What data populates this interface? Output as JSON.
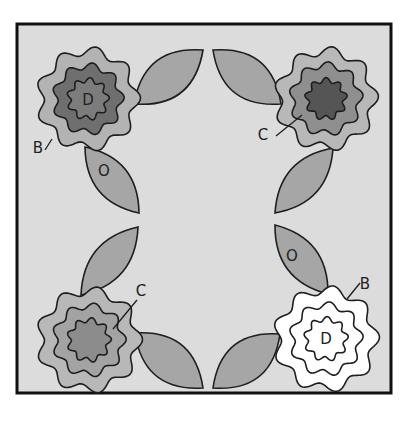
{
  "diagram": {
    "title": "",
    "frame": {
      "x": 17,
      "y": 24,
      "width": 374,
      "height": 369,
      "fill": "#dcdcdc",
      "stroke": "#111111",
      "stroke_width": 3
    },
    "colors": {
      "leaf": "#a6a6a6",
      "outline": "#1e1e1e",
      "label": "#222222"
    },
    "flowers": [
      {
        "id": "top-left",
        "cx": 88,
        "cy": 99,
        "lobes": 9,
        "rotation": 0.2,
        "rings": [
          {
            "r": 48,
            "amp": 4.5,
            "fill": "#b3b3b3"
          },
          {
            "r": 33,
            "amp": 3.2,
            "fill": "#6f6f6f"
          },
          {
            "r": 19,
            "amp": 2.4,
            "fill": "#7c7c7c"
          }
        ],
        "center_label": "D"
      },
      {
        "id": "top-right",
        "cx": 326,
        "cy": 99,
        "lobes": 9,
        "rotation": 0.5,
        "rings": [
          {
            "r": 48,
            "amp": 4.5,
            "fill": "#b8b8b8"
          },
          {
            "r": 34,
            "amp": 3.2,
            "fill": "#8f8f8f"
          },
          {
            "r": 19,
            "amp": 2.4,
            "fill": "#555555"
          }
        ],
        "center_label": ""
      },
      {
        "id": "bottom-left",
        "cx": 89,
        "cy": 340,
        "lobes": 9,
        "rotation": 0.1,
        "rings": [
          {
            "r": 49,
            "amp": 4.5,
            "fill": "#b8b8b8"
          },
          {
            "r": 34,
            "amp": 3.2,
            "fill": "#a3a3a3"
          },
          {
            "r": 20,
            "amp": 2.4,
            "fill": "#8c8c8c"
          }
        ],
        "center_label": ""
      },
      {
        "id": "bottom-right",
        "cx": 326,
        "cy": 339,
        "lobes": 9,
        "rotation": 0.35,
        "rings": [
          {
            "r": 49,
            "amp": 4.5,
            "fill": "#ffffff"
          },
          {
            "r": 34,
            "amp": 3.2,
            "fill": "#ffffff"
          },
          {
            "r": 20,
            "amp": 2.4,
            "fill": "#ffffff"
          }
        ],
        "center_label": "D"
      }
    ],
    "leaves": [
      {
        "id": "tl-right",
        "x1": 134,
        "y1": 104,
        "x2": 203,
        "y2": 50,
        "width": 20
      },
      {
        "id": "tl-bottom",
        "x1": 85,
        "y1": 147,
        "x2": 139,
        "y2": 213,
        "width": 17
      },
      {
        "id": "tr-left",
        "x1": 281,
        "y1": 104,
        "x2": 213,
        "y2": 50,
        "width": 20
      },
      {
        "id": "tr-bottom",
        "x1": 333,
        "y1": 148,
        "x2": 275,
        "y2": 213,
        "width": 17
      },
      {
        "id": "bl-top",
        "x1": 81,
        "y1": 295,
        "x2": 138,
        "y2": 227,
        "width": 17
      },
      {
        "id": "bl-right",
        "x1": 135,
        "y1": 333,
        "x2": 203,
        "y2": 388,
        "width": 20
      },
      {
        "id": "br-top",
        "x1": 328,
        "y1": 294,
        "x2": 275,
        "y2": 225,
        "width": 17
      },
      {
        "id": "br-left",
        "x1": 280,
        "y1": 334,
        "x2": 213,
        "y2": 388,
        "width": 20
      }
    ],
    "labels": [
      {
        "id": "label-d-top-left",
        "text": "D",
        "x": 88,
        "y": 105
      },
      {
        "id": "label-b-top-left",
        "text": "B",
        "x": 38,
        "y": 153
      },
      {
        "id": "label-o-top-left",
        "text": "O",
        "x": 104,
        "y": 176
      },
      {
        "id": "label-c-top-right",
        "text": "C",
        "x": 263,
        "y": 140
      },
      {
        "id": "label-c-bottom-left",
        "text": "C",
        "x": 141,
        "y": 296
      },
      {
        "id": "label-o-bottom-right",
        "text": "O",
        "x": 292,
        "y": 261
      },
      {
        "id": "label-b-bottom-right",
        "text": "B",
        "x": 365,
        "y": 289
      },
      {
        "id": "label-d-bottom-right",
        "text": "D",
        "x": 326,
        "y": 344
      }
    ],
    "leader_lines": [
      {
        "id": "leader-b-top-left",
        "x1": 45,
        "y1": 150,
        "x2": 52,
        "y2": 139
      },
      {
        "id": "leader-c-top-right",
        "x1": 276,
        "y1": 136,
        "x2": 302,
        "y2": 115
      },
      {
        "id": "leader-c-bottom-left",
        "x1": 137,
        "y1": 300,
        "x2": 113,
        "y2": 329
      },
      {
        "id": "leader-b-bottom-right",
        "x1": 360,
        "y1": 283,
        "x2": 347,
        "y2": 299
      }
    ]
  }
}
